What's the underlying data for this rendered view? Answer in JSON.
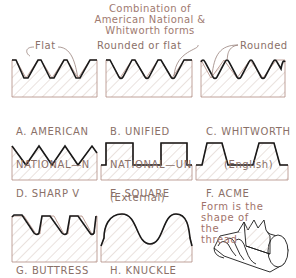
{
  "title": {
    "lines": [
      "Combination of",
      "American National &",
      "Whitworth forms"
    ]
  },
  "callouts": {
    "flat": "Flat",
    "rounded_or_flat": "Rounded or flat",
    "rounded": "Rounded"
  },
  "thread_forms": [
    {
      "id": "A",
      "label_line1": "A. AMERICAN",
      "label_line2": "NATIONAL—N",
      "label_line3": ""
    },
    {
      "id": "B",
      "label_line1": "B. UNIFIED",
      "label_line2": "NATIONAL—UN",
      "label_line3": "(External)"
    },
    {
      "id": "C",
      "label_line1": "C. WHITWORTH",
      "label_line2": "(English)",
      "label_line3": ""
    },
    {
      "id": "D",
      "label_line1": "D. SHARP V"
    },
    {
      "id": "E",
      "label_line1": "E. SQUARE"
    },
    {
      "id": "F",
      "label_line1": "F. ACME"
    },
    {
      "id": "G",
      "label_line1": "G. BUTTRESS"
    },
    {
      "id": "H",
      "label_line1": "H. KNUCKLE"
    }
  ],
  "note": {
    "lines": [
      "Form is the",
      "shape of",
      "the",
      "thread"
    ]
  },
  "colors": {
    "profile_line": "#1a1a1a",
    "section_outline": "#b08a80",
    "hatch": "#d0c0b8",
    "text": "#8a7068"
  }
}
